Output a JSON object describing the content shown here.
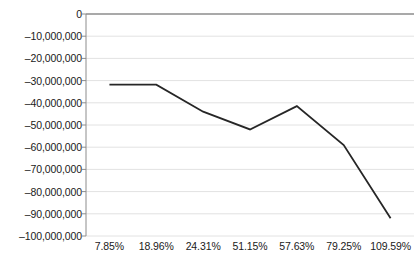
{
  "chart_data": {
    "type": "line",
    "title": "",
    "xlabel": "",
    "ylabel": "",
    "categories": [
      "7.85%",
      "18.96%",
      "24.31%",
      "51.15%",
      "57.63%",
      "79.25%",
      "109.59%"
    ],
    "values": [
      -31800000,
      -31800000,
      -44000000,
      -52000000,
      -41500000,
      -59000000,
      -92000000
    ],
    "ylim": [
      -100000000,
      0
    ],
    "ytick_labels": [
      "0",
      "–10,000,000",
      "–20,000,000",
      "–30,000,000",
      "–40,000,000",
      "–50,000,000",
      "–60,000,000",
      "–70,000,000",
      "–80,000,000",
      "–90,000,000",
      "–100,000,000"
    ],
    "ytick_values": [
      0,
      -10000000,
      -20000000,
      -30000000,
      -40000000,
      -50000000,
      -60000000,
      -70000000,
      -80000000,
      -90000000,
      -100000000
    ],
    "grid": true,
    "legend": false,
    "series": [
      {
        "name": "series-1",
        "color": "#262626",
        "values": [
          -31800000,
          -31800000,
          -44000000,
          -52000000,
          -41500000,
          -59000000,
          -92000000
        ]
      }
    ],
    "colors": {
      "line": "#262626",
      "gridline": "#e2e2e2",
      "axis": "#8c8c8c",
      "zero_line": "#8c8c8c",
      "text": "#1a1a1a",
      "background": "#ffffff"
    }
  }
}
